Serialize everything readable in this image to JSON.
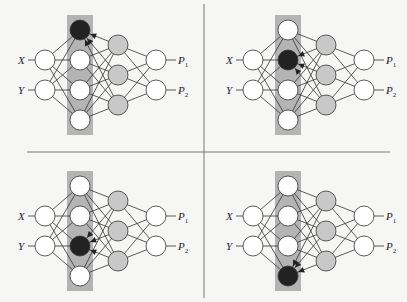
{
  "colors": {
    "background": "#f6f6f4",
    "highlight_band": "#b4b4b4",
    "node_white": "#ffffff",
    "node_hidden2": "#c8c8c8",
    "node_active": "#222222",
    "edge": "#333333",
    "divider": "#777777"
  },
  "labels": {
    "input_x": "X",
    "input_y": "Y",
    "output_p": "P",
    "output_1_sub": "1",
    "output_2_sub": "2"
  },
  "panels": [
    {
      "name": "panel-top-left",
      "active_node": 0
    },
    {
      "name": "panel-top-right",
      "active_node": 1
    },
    {
      "name": "panel-bottom-left",
      "active_node": 2
    },
    {
      "name": "panel-bottom-right",
      "active_node": 3
    }
  ]
}
